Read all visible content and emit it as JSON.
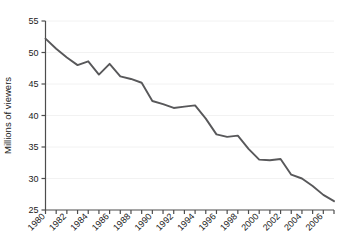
{
  "chart_data": {
    "type": "line",
    "title": "",
    "xlabel": "",
    "ylabel": "Millions of viewers",
    "xlim": [
      1980,
      2007
    ],
    "ylim": [
      25,
      55
    ],
    "yticks": [
      25,
      30,
      35,
      40,
      45,
      50,
      55
    ],
    "xticks": [
      1980,
      1981,
      1982,
      1983,
      1984,
      1985,
      1986,
      1987,
      1988,
      1989,
      1990,
      1991,
      1992,
      1993,
      1994,
      1995,
      1996,
      1997,
      1998,
      1999,
      2000,
      2001,
      2002,
      2003,
      2004,
      2005,
      2006,
      2007
    ],
    "xtick_labels": [
      "1980",
      "",
      "1982",
      "",
      "1984",
      "",
      "1986",
      "",
      "1988",
      "",
      "1990",
      "",
      "1992",
      "",
      "1994",
      "",
      "1996",
      "",
      "1998",
      "",
      "2000",
      "",
      "2002",
      "",
      "2004",
      "",
      "2006",
      ""
    ],
    "grid": true,
    "grid_axis": "y",
    "legend": "none",
    "x": [
      1980,
      1981,
      1982,
      1983,
      1984,
      1985,
      1986,
      1987,
      1988,
      1989,
      1990,
      1991,
      1992,
      1993,
      1994,
      1995,
      1996,
      1997,
      1998,
      1999,
      2000,
      2001,
      2002,
      2003,
      2004,
      2005,
      2006,
      2007
    ],
    "values": [
      52.2,
      50.6,
      49.2,
      48.0,
      48.6,
      46.5,
      48.2,
      46.2,
      45.8,
      45.2,
      42.3,
      41.8,
      41.2,
      41.4,
      41.6,
      39.5,
      37.0,
      36.6,
      36.8,
      34.7,
      33.0,
      32.9,
      33.1,
      30.6,
      30.0,
      28.8,
      27.4,
      26.4
    ],
    "series_name": "Millions of viewers",
    "line_color": "#58585a",
    "grid_color": "#f2f2f2",
    "axis_color": "#4d4d4d"
  },
  "labels": {
    "y_axis_title": "Millions of viewers"
  }
}
